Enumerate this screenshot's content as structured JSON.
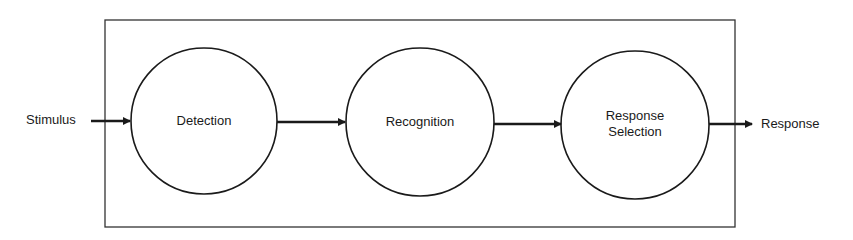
{
  "diagram": {
    "type": "flowchart",
    "input_label": "Stimulus",
    "output_label": "Response",
    "stages": [
      {
        "label": "Detection"
      },
      {
        "label": "Recognition"
      },
      {
        "label_line1": "Response",
        "label_line2": "Selection"
      }
    ],
    "edges": [
      {
        "from": "Stimulus",
        "to": "Detection"
      },
      {
        "from": "Detection",
        "to": "Recognition"
      },
      {
        "from": "Recognition",
        "to": "Response Selection"
      },
      {
        "from": "Response Selection",
        "to": "Response"
      }
    ],
    "colors": {
      "stroke": "#1a1a1a",
      "background": "#ffffff"
    }
  }
}
